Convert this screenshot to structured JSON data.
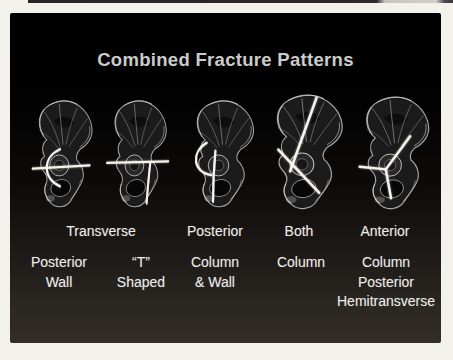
{
  "colors": {
    "photo_margin": "#f3f1ec",
    "slide_top": "#000000",
    "slide_bottom": "#332d28",
    "title_text": "#cbcbcb",
    "label_text": "#edebe7",
    "fracture_line": "#f6f4ea"
  },
  "slide": {
    "title": "Combined Fracture Patterns",
    "label_row_top": [
      "Transverse",
      "Posterior",
      "Both",
      "Anterior"
    ],
    "label_row_bottom": [
      [
        "Posterior",
        "Wall"
      ],
      [
        "“T”",
        "Shaped"
      ],
      [
        "Column",
        "& Wall"
      ],
      [
        "Column"
      ],
      [
        "Column",
        "Posterior",
        "Hemitransverse"
      ]
    ]
  }
}
